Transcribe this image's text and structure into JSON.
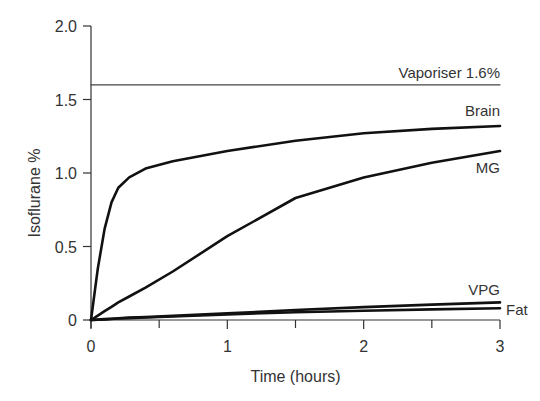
{
  "chart_data": {
    "type": "line",
    "title": "",
    "xlabel": "Time (hours)",
    "ylabel": "Isoflurane %",
    "xlim": [
      0,
      3
    ],
    "ylim": [
      0,
      2.0
    ],
    "x_ticks": [
      "0",
      "1",
      "2",
      "3"
    ],
    "x_minor_ticks": [
      0.5,
      1.5,
      2.5
    ],
    "y_ticks": [
      "0",
      "0.5",
      "1.0",
      "1.5",
      "2.0"
    ],
    "grid": false,
    "legend": "inline labels at right end of lines",
    "x": [
      0,
      0.05,
      0.1,
      0.15,
      0.2,
      0.28,
      0.4,
      0.6,
      1.0,
      1.5,
      2.0,
      2.5,
      3.0
    ],
    "series": [
      {
        "name": "Vaporiser 1.6%",
        "label": "Vaporiser 1.6%",
        "values": [
          1.6,
          1.6,
          1.6,
          1.6,
          1.6,
          1.6,
          1.6,
          1.6,
          1.6,
          1.6,
          1.6,
          1.6,
          1.6
        ],
        "style": "thin"
      },
      {
        "name": "Brain",
        "label": "Brain",
        "values": [
          0,
          0.35,
          0.62,
          0.8,
          0.9,
          0.97,
          1.03,
          1.08,
          1.15,
          1.22,
          1.27,
          1.3,
          1.32
        ]
      },
      {
        "name": "MG",
        "label": "MG",
        "values": [
          0,
          0.03,
          0.06,
          0.09,
          0.12,
          0.16,
          0.22,
          0.33,
          0.57,
          0.83,
          0.97,
          1.07,
          1.15
        ]
      },
      {
        "name": "VPG",
        "label": "VPG",
        "values": [
          0,
          0.003,
          0.006,
          0.009,
          0.012,
          0.016,
          0.02,
          0.028,
          0.045,
          0.068,
          0.088,
          0.105,
          0.12
        ]
      },
      {
        "name": "Fat",
        "label": "Fat",
        "values": [
          0,
          0.002,
          0.004,
          0.007,
          0.01,
          0.013,
          0.017,
          0.024,
          0.038,
          0.053,
          0.063,
          0.072,
          0.08
        ]
      }
    ]
  }
}
